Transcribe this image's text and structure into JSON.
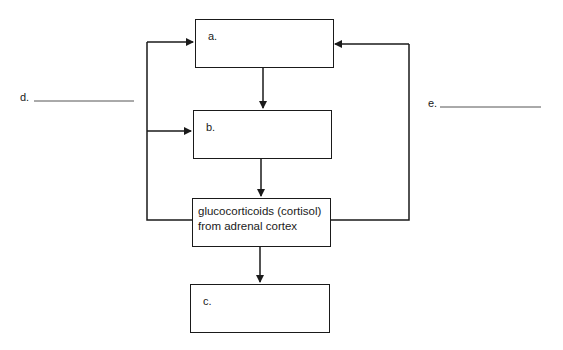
{
  "diagram": {
    "boxes": [
      {
        "id": "a",
        "label": "a."
      },
      {
        "id": "b",
        "label": "b."
      },
      {
        "id": "gluco",
        "line1": "glucocorticoids (cortisol)",
        "line2": "from adrenal cortex"
      },
      {
        "id": "c",
        "label": "c."
      }
    ],
    "blanks": [
      {
        "id": "d",
        "label": "d."
      },
      {
        "id": "e",
        "label": "e."
      }
    ],
    "colors": {
      "line": "#1a1a1a",
      "background": "#ffffff"
    }
  }
}
